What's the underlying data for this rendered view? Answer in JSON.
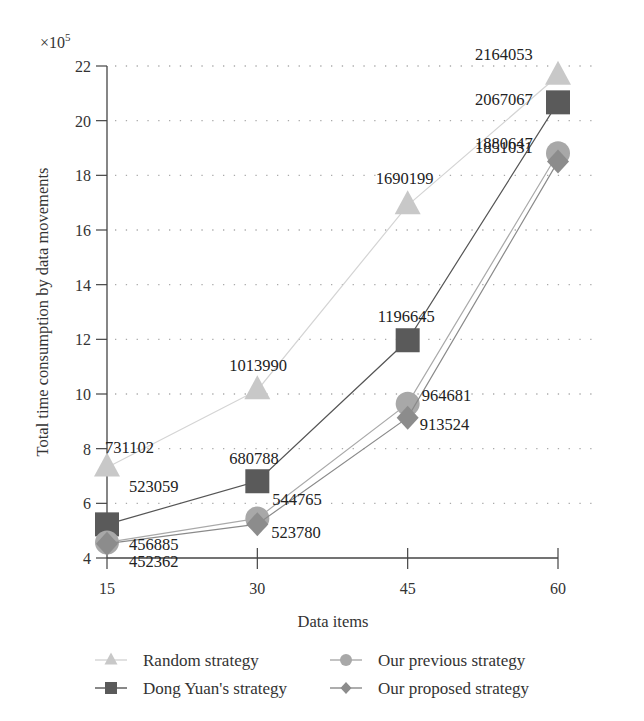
{
  "chart_data": {
    "type": "line",
    "title": "",
    "xlabel": "Data items",
    "ylabel": "Total time consumption by data movements",
    "y_multiplier": "×10",
    "y_multiplier_exp": "5",
    "x": [
      15,
      30,
      45,
      60
    ],
    "x_ticks": [
      "15",
      "30",
      "45",
      "60"
    ],
    "y_ticks": [
      "4",
      "6",
      "8",
      "10",
      "12",
      "14",
      "16",
      "18",
      "20",
      "22"
    ],
    "ylim": [
      4,
      22
    ],
    "grid": "horizontal dotted",
    "legend_position": "bottom",
    "series": [
      {
        "name": "Random strategy",
        "marker": "triangle",
        "color": "#c8c8c8",
        "values": [
          731102,
          1013990,
          1690199,
          2164053
        ],
        "labels": [
          "731102",
          "1013990",
          "1690199",
          "2164053"
        ]
      },
      {
        "name": "Dong Yuan's strategy",
        "marker": "square",
        "color": "#5a5a5a",
        "values": [
          523059,
          680788,
          1196645,
          2067067
        ],
        "labels": [
          "523059",
          "680788",
          "1196645",
          "2067067"
        ]
      },
      {
        "name": "Our previous strategy",
        "marker": "circle",
        "color": "#a8a8a8",
        "values": [
          456885,
          544765,
          964681,
          1880647
        ],
        "labels": [
          "456885",
          "544765",
          "964681",
          "1880647"
        ]
      },
      {
        "name": "Our proposed strategy",
        "marker": "diamond",
        "color": "#8c8c8c",
        "values": [
          452362,
          523780,
          913524,
          1851031
        ],
        "labels": [
          "452362",
          "523780",
          "913524",
          "1851031"
        ]
      }
    ]
  }
}
